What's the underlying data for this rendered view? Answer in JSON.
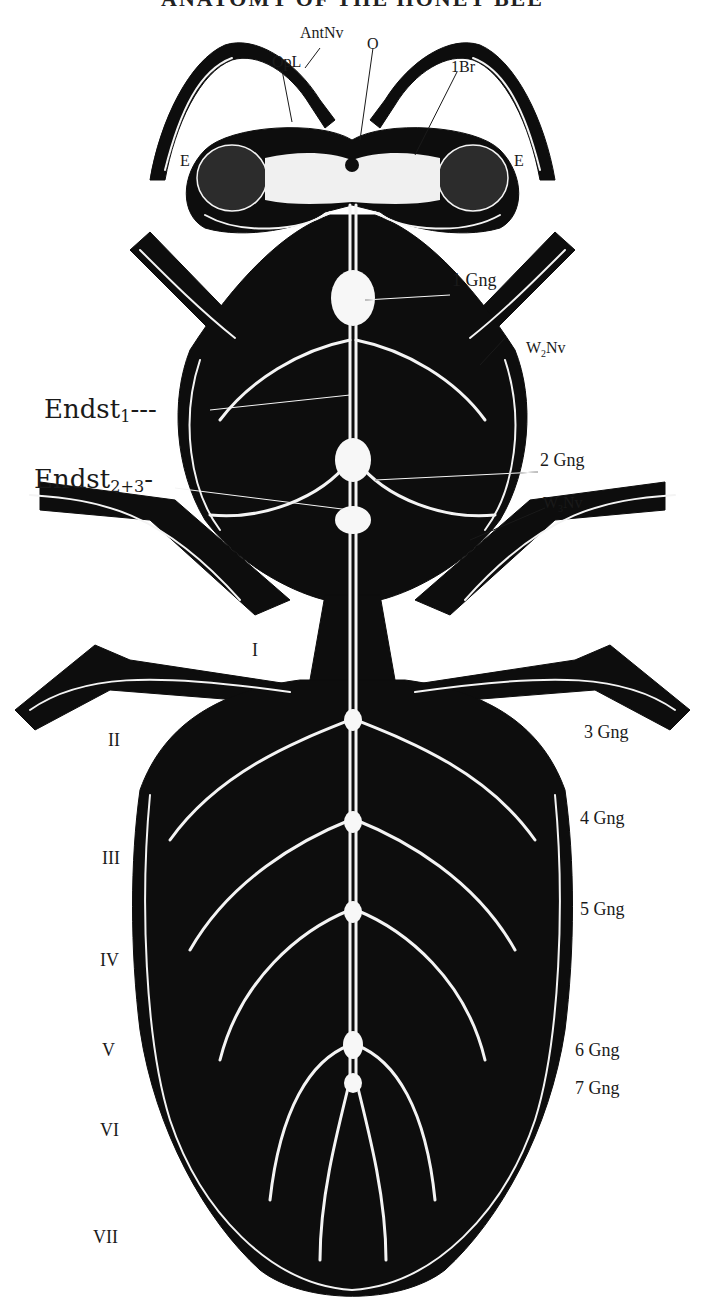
{
  "title": "ANATOMY OF THE HONEY BEE",
  "colors": {
    "body": "#0d0d0d",
    "nerve": "#f4f4f4",
    "background": "#ffffff",
    "text": "#1a1a1a"
  },
  "labels": {
    "antennal_nerve": "AntNv",
    "ocellus": "O",
    "optic_lobe": "OpL",
    "brain": "1Br",
    "eye_left": "E",
    "eye_right": "E",
    "ganglion_1": "1 Gng",
    "endosternite_1": {
      "base": "Endst",
      "sub": "1",
      "leader": "---"
    },
    "wing2_nerve": {
      "base": "W",
      "sub": "2",
      "rest": "Nv"
    },
    "ganglion_2": "2 Gng",
    "endosternite_23": {
      "base": "Endst",
      "sub": "2+3",
      "leader": "-"
    },
    "wing3_nerve": {
      "base": "W",
      "sub": "3",
      "rest": "Nv"
    },
    "ganglion_3": "3 Gng",
    "ganglion_4": "4 Gng",
    "ganglion_5": "5 Gng",
    "ganglion_6": "6 Gng",
    "ganglion_7": "7 Gng"
  },
  "segments": [
    "I",
    "II",
    "III",
    "IV",
    "V",
    "VI",
    "VII"
  ]
}
